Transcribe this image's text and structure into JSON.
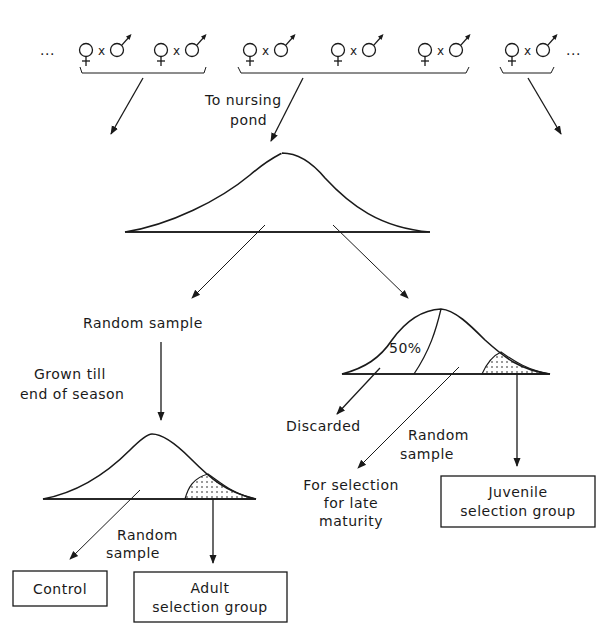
{
  "crosses": {
    "left_ellipsis": "...",
    "right_ellipsis": "...",
    "times": "x",
    "groups": [
      {
        "pairs": 2
      },
      {
        "pairs": 3
      },
      {
        "pairs": 1
      }
    ]
  },
  "labels": {
    "to_nursing_pond_1": "To nursing",
    "to_nursing_pond_2": "pond",
    "random_sample_left": "Random sample",
    "grown_till_1": "Grown till",
    "grown_till_2": "end of season",
    "random_sample_adult_1": "Random",
    "random_sample_adult_2": "sample",
    "fifty_percent": "50%",
    "discarded": "Discarded",
    "random_sample_right_1": "Random",
    "random_sample_right_2": "sample",
    "for_selection_1": "For selection",
    "for_selection_2": "for late",
    "for_selection_3": "maturity"
  },
  "boxes": {
    "control": "Control",
    "adult_1": "Adult",
    "adult_2": "selection group",
    "juvenile_1": "Juvenile",
    "juvenile_2": "selection group"
  },
  "colors": {
    "ink": "#1a1a1a",
    "background": "#ffffff"
  }
}
